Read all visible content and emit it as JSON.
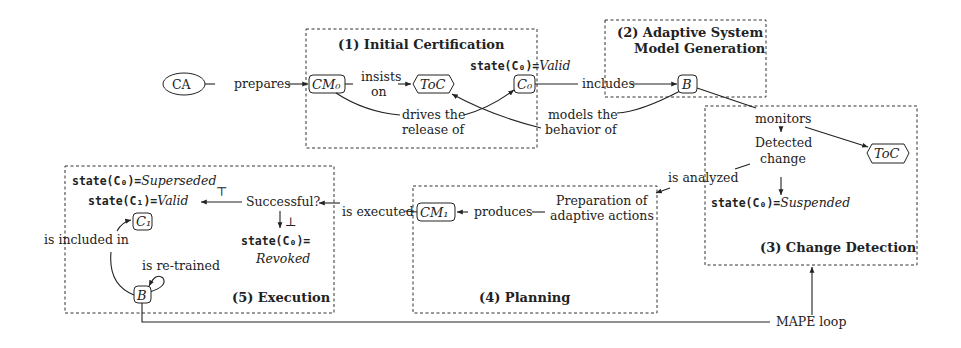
{
  "phases": [
    {
      "id": 1,
      "title": "(1) Initial Certification"
    },
    {
      "id": 2,
      "title_line1": "(2) Adaptive System",
      "title_line2": "Model Generation"
    },
    {
      "id": 3,
      "title": "(3) Change Detection"
    },
    {
      "id": 4,
      "title": "(4) Planning"
    },
    {
      "id": 5,
      "title": "(5) Execution"
    }
  ],
  "nodes": {
    "ca": "CA",
    "cm0": "CM₀",
    "toc1": "ToC",
    "c0": "C₀",
    "b1": "B",
    "toc2": "ToC",
    "cm1": "CM₁",
    "c1": "C₁",
    "b2": "B"
  },
  "states": {
    "c0_valid_prefix": "state(C₀)=",
    "c0_valid_value": "Valid",
    "c0_suspended_prefix": "state(C₀)=",
    "c0_suspended_value": "Suspended",
    "c0_superseded_prefix": "state(C₀)=",
    "c0_superseded_value": "Superseded",
    "c1_valid_prefix": "state(C₁)=",
    "c1_valid_value": "Valid",
    "c0_revoked_prefix": "state(C₀)=",
    "c0_revoked_value": "Revoked"
  },
  "edge_labels": {
    "prepares": "prepares",
    "insists_1": "insists",
    "insists_2": "on",
    "drives_1": "drives the",
    "drives_2": "release of",
    "models_1": "models the",
    "models_2": "behavior of",
    "includes": "includes",
    "monitors": "monitors",
    "detected_1": "Detected",
    "detected_2": "change",
    "is_analyzed": "is analyzed",
    "prep_1": "Preparation of",
    "prep_2": "adaptive actions",
    "produces": "produces",
    "is_executed": "is executed",
    "successful": "Successful?",
    "top": "⊤",
    "bottom": "⊥",
    "is_included_in": "is included in",
    "is_retrained": "is re-trained",
    "mape_loop": "MAPE loop"
  }
}
